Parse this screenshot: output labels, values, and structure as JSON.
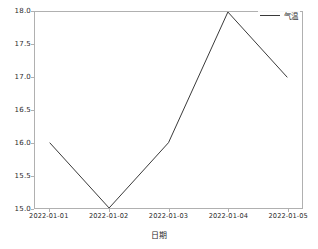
{
  "chart_data": {
    "type": "line",
    "title": "",
    "xlabel": "日期",
    "ylabel": "",
    "categories": [
      "2022-01-01",
      "2022-01-02",
      "2022-01-03",
      "2022-01-04",
      "2022-01-05"
    ],
    "series": [
      {
        "name": "气温",
        "values": [
          16.0,
          15.0,
          16.0,
          18.0,
          17.0
        ],
        "color": "#3a3a3a"
      }
    ],
    "ylim": [
      15.0,
      18.0
    ],
    "yticks": [
      "15.0",
      "15.5",
      "16.0",
      "16.5",
      "17.0",
      "17.5",
      "18.0"
    ],
    "ytick_values": [
      15.0,
      15.5,
      16.0,
      16.5,
      17.0,
      17.5,
      18.0
    ],
    "grid": false,
    "legend_position": "upper right",
    "markers": false
  },
  "legend": {
    "entries": [
      {
        "label": "气温",
        "color": "#3a3a3a"
      }
    ]
  },
  "axes": {
    "spine_color": "#b0b0b0",
    "tick_color": "#2b2b2b"
  }
}
